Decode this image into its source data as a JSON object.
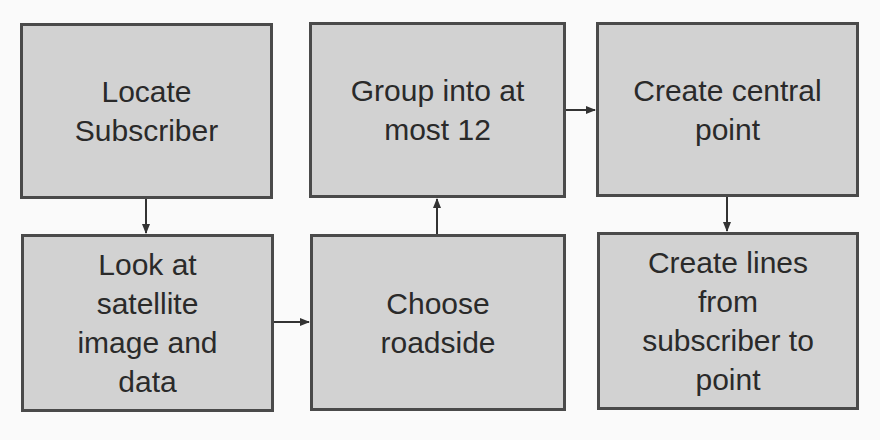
{
  "diagram": {
    "type": "flowchart",
    "colors": {
      "background": "#fafafa",
      "box_fill": "#d2d2d2",
      "box_border": "#4a4a4a",
      "text": "#2a2a2a",
      "arrow": "#333333"
    },
    "nodes": [
      {
        "id": "n1",
        "label": "Locate\nSubscriber"
      },
      {
        "id": "n2",
        "label": "Group into at\nmost 12"
      },
      {
        "id": "n3",
        "label": "Create central\npoint"
      },
      {
        "id": "n4",
        "label": "Look at\nsatellite\nimage and\ndata"
      },
      {
        "id": "n5",
        "label": "Choose\nroadside"
      },
      {
        "id": "n6",
        "label": "Create lines\nfrom\nsubscriber to\npoint"
      }
    ],
    "edges": [
      {
        "from": "n1",
        "to": "n4"
      },
      {
        "from": "n4",
        "to": "n5"
      },
      {
        "from": "n5",
        "to": "n2"
      },
      {
        "from": "n2",
        "to": "n3"
      },
      {
        "from": "n3",
        "to": "n6"
      }
    ]
  }
}
